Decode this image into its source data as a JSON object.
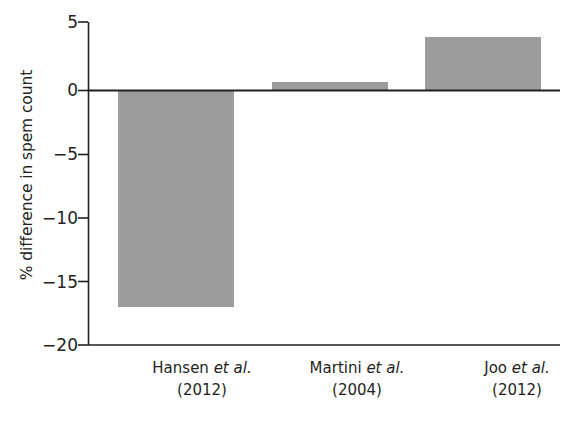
{
  "chart_data": {
    "type": "bar",
    "title": "",
    "subtitle": "",
    "xlabel": "",
    "ylabel": "% difference in spem count",
    "ylim": [
      -20,
      5
    ],
    "yticks": [
      5,
      0,
      -5,
      -10,
      -15,
      -20
    ],
    "ytick_labels": [
      "5",
      "0",
      "−5",
      "−10",
      "−15",
      "−20"
    ],
    "grid": false,
    "legend": null,
    "bar_color": "#9c9c9c",
    "axis_color": "#231f20",
    "categories": [
      "Hansen et al. (2012)",
      "Martini et al. (2004)",
      "Joo et al. (2012)"
    ],
    "category_parts": [
      {
        "author": "Hansen ",
        "italic": "et al.",
        "year": "(2012)"
      },
      {
        "author": "Martini ",
        "italic": "et al.",
        "year": "(2004)"
      },
      {
        "author": "Joo ",
        "italic": "et al.",
        "year": "(2012)"
      }
    ],
    "values": [
      -17.0,
      0.7,
      4.2
    ]
  },
  "axis": {
    "y_title": "% difference in spem count",
    "ticks": {
      "t0": "5",
      "t1": "0",
      "t2": "−5",
      "t3": "−10",
      "t4": "−15",
      "t5": "−20"
    }
  },
  "xlabels": {
    "b0": {
      "author": "Hansen ",
      "italic": "et al.",
      "year": "(2012)"
    },
    "b1": {
      "author": "Martini ",
      "italic": "et al.",
      "year": "(2004)"
    },
    "b2": {
      "author": "Joo ",
      "italic": "et al.",
      "year": "(2012)"
    }
  }
}
